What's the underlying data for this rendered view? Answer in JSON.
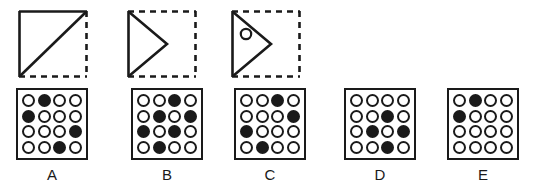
{
  "puzzle": {
    "type": "visual-analogy-matrix",
    "stroke_color": "#1a1a1a",
    "fill_color": "#1a1a1a",
    "background_color": "#ffffff"
  },
  "sequence": {
    "shapes": [
      {
        "id": "shape-1",
        "name": "square-with-diagonal",
        "square_edges": {
          "top": "solid",
          "left": "solid",
          "right": "dashed",
          "bottom": "dashed"
        },
        "interior": "diagonal-line-bottom-left-to-top-right",
        "has_circle": false
      },
      {
        "id": "shape-2",
        "name": "dashed-square-with-right-triangle",
        "square_edges": {
          "top": "dashed",
          "left": "solid",
          "right": "dashed",
          "bottom": "dashed"
        },
        "interior": "right-pointing-triangle",
        "has_circle": false
      },
      {
        "id": "shape-3",
        "name": "dashed-square-with-right-triangle-and-circle",
        "square_edges": {
          "top": "dashed",
          "left": "solid",
          "right": "dashed",
          "bottom": "dashed"
        },
        "interior": "right-pointing-triangle",
        "has_circle": true
      }
    ]
  },
  "options": [
    {
      "label": "A",
      "rows": [
        [
          0,
          1,
          0,
          0
        ],
        [
          1,
          0,
          0,
          0
        ],
        [
          0,
          0,
          0,
          1
        ],
        [
          0,
          0,
          1,
          0
        ]
      ]
    },
    {
      "label": "B",
      "rows": [
        [
          0,
          0,
          1,
          0
        ],
        [
          0,
          1,
          0,
          1
        ],
        [
          1,
          0,
          1,
          0
        ],
        [
          0,
          1,
          0,
          0
        ]
      ]
    },
    {
      "label": "C",
      "rows": [
        [
          0,
          0,
          1,
          0
        ],
        [
          0,
          0,
          0,
          1
        ],
        [
          1,
          0,
          0,
          0
        ],
        [
          0,
          1,
          0,
          0
        ]
      ]
    },
    {
      "label": "D",
      "rows": [
        [
          0,
          0,
          0,
          0
        ],
        [
          0,
          0,
          1,
          0
        ],
        [
          0,
          1,
          0,
          1
        ],
        [
          0,
          0,
          1,
          0
        ]
      ]
    },
    {
      "label": "E",
      "rows": [
        [
          0,
          1,
          0,
          0
        ],
        [
          1,
          0,
          0,
          0
        ],
        [
          0,
          0,
          0,
          0
        ],
        [
          0,
          0,
          0,
          0
        ]
      ]
    }
  ]
}
